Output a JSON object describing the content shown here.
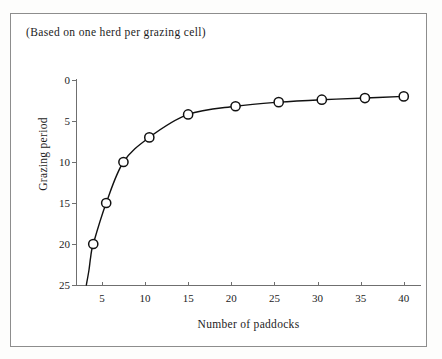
{
  "figure": {
    "caption": "(Based on one herd per grazing cell)",
    "frame_color": "#8d8d8d",
    "background": "#ffffff"
  },
  "chart_data": {
    "type": "line",
    "title": "",
    "subtitle": "(Based on one herd per grazing cell)",
    "xlabel": "Number of paddocks",
    "ylabel": "Grazing period",
    "xlim": [
      2.0,
      42.0
    ],
    "ylim": [
      0,
      25
    ],
    "y_axis_inverted": true,
    "grid": false,
    "legend": null,
    "line_color": "#111111",
    "marker_style": "open-circle",
    "marker_face_color": "#ffffff",
    "marker_edge_color": "#111111",
    "xticks": [
      5,
      10,
      15,
      20,
      25,
      30,
      35,
      40
    ],
    "xtick_labels": [
      "5",
      "10",
      "15",
      "20",
      "25",
      "30",
      "35",
      "40"
    ],
    "yticks": [
      0,
      5,
      10,
      15,
      20,
      25
    ],
    "ytick_labels": [
      "0",
      "5",
      "10",
      "15",
      "20",
      "25"
    ],
    "x": [
      4,
      5.5,
      7.5,
      10.5,
      15,
      20.5,
      25.5,
      30.5,
      35.5,
      40
    ],
    "values": [
      20,
      15,
      10,
      7,
      4.2,
      3.2,
      2.7,
      2.4,
      2.2,
      2.0
    ],
    "points": [
      {
        "x": 4,
        "y": 20.0
      },
      {
        "x": 5.5,
        "y": 15.0
      },
      {
        "x": 7.5,
        "y": 10.0
      },
      {
        "x": 10.5,
        "y": 7.0
      },
      {
        "x": 15,
        "y": 4.2
      },
      {
        "x": 20.5,
        "y": 3.2
      },
      {
        "x": 25.5,
        "y": 2.7
      },
      {
        "x": 30.5,
        "y": 2.4
      },
      {
        "x": 35.5,
        "y": 2.2
      },
      {
        "x": 40,
        "y": 2.0
      }
    ],
    "curve_tail": [
      {
        "x": 3.2,
        "y": 25.0
      },
      {
        "x": 3.5,
        "y": 23.2
      },
      {
        "x": 3.7,
        "y": 21.6
      }
    ]
  }
}
